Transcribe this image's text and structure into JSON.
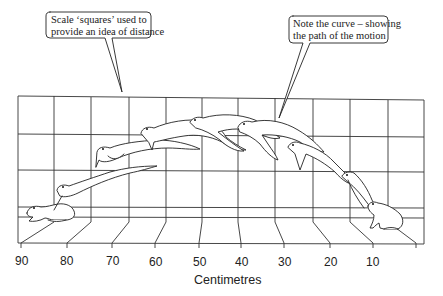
{
  "callouts": [
    {
      "id": "scale",
      "lines": [
        "Scale ‘squares’ used to",
        "provide an idea of distance"
      ]
    },
    {
      "id": "curve",
      "lines": [
        "Note the curve – showing",
        "the path of the motion"
      ]
    }
  ],
  "axis": {
    "title": "Centimetres",
    "ticks": [
      "90",
      "80",
      "70",
      "60",
      "50",
      "40",
      "30",
      "20",
      "10"
    ]
  },
  "figure": {
    "frames": 9,
    "line_color": "#222222",
    "background": "#ffffff"
  }
}
